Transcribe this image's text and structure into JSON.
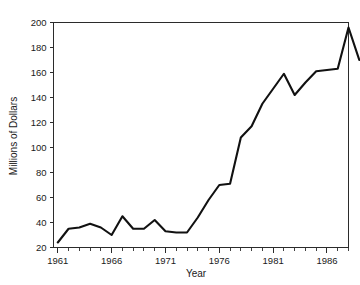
{
  "chart_data": {
    "type": "line",
    "title": "",
    "xlabel": "Year",
    "ylabel": "Millions of Dollars",
    "xlim": [
      1960.6,
      1988.0
    ],
    "ylim": [
      20,
      200
    ],
    "grid": false,
    "legend": false,
    "line_color": "#111111",
    "x": [
      1961,
      1962,
      1963,
      1964,
      1965,
      1966,
      1967,
      1968,
      1969,
      1970,
      1971,
      1972,
      1973,
      1974,
      1975,
      1976,
      1977,
      1978,
      1979,
      1980,
      1981,
      1982,
      1983,
      1984,
      1985,
      1986,
      1987,
      1988
    ],
    "values": [
      24,
      35,
      36,
      39,
      36,
      30,
      45,
      35,
      35,
      42,
      33,
      32,
      32,
      44,
      58,
      70,
      71,
      108,
      117,
      135,
      147,
      159,
      142,
      152,
      161,
      162,
      163,
      196
    ],
    "series": [
      {
        "name": "Millions of Dollars",
        "values": [
          24,
          35,
          36,
          39,
          36,
          30,
          45,
          35,
          35,
          42,
          33,
          32,
          32,
          44,
          58,
          70,
          71,
          108,
          117,
          135,
          147,
          159,
          142,
          152,
          161,
          162,
          163,
          196
        ]
      }
    ],
    "final_value": 170,
    "y_ticks": [
      20,
      40,
      60,
      80,
      100,
      120,
      140,
      160,
      180,
      200
    ],
    "x_major_ticks": [
      1961,
      1966,
      1971,
      1976,
      1981,
      1986
    ],
    "x_minor_tick_step": 1,
    "x_tick_labels": [
      "1961",
      "1966",
      "1971",
      "1976",
      "1981",
      "1986"
    ],
    "y_tick_labels": [
      "20",
      "40",
      "60",
      "80",
      "100",
      "120",
      "140",
      "160",
      "180",
      "200"
    ],
    "peak": {
      "year": 1987,
      "value": 196
    },
    "minimum": {
      "year": 1961,
      "value": 24
    }
  }
}
